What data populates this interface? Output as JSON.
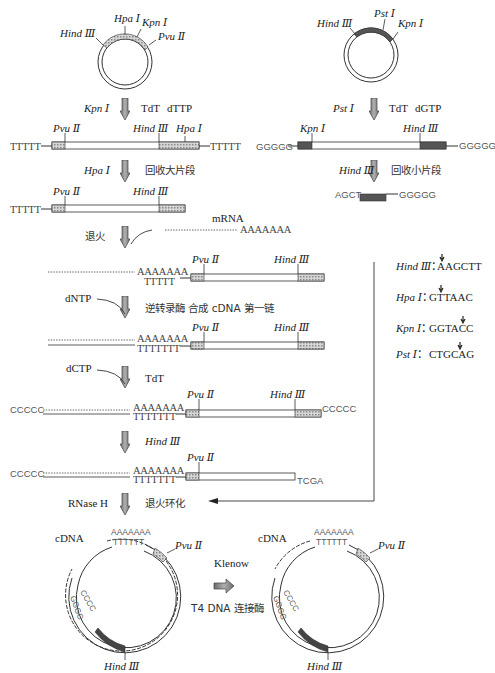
{
  "colors": {
    "line": "#333333",
    "dark_segment": "#3a3a3a",
    "hatched_segment": "#bfbfbf",
    "arrow_fill": "#8a8a8a",
    "background": "#ffffff"
  },
  "left_plasmid": {
    "sites": [
      "Hpa Ⅰ",
      "Kpn Ⅰ",
      "Hind Ⅲ",
      "Pvu Ⅱ"
    ]
  },
  "right_plasmid": {
    "sites": [
      "Pst Ⅰ",
      "Hind Ⅲ",
      "Kpn Ⅰ"
    ]
  },
  "steps": {
    "s1": {
      "enzyme": "Kpn Ⅰ",
      "note1": "TdT",
      "note2": "dTTP"
    },
    "s2": {
      "enzyme": "Hpa Ⅰ",
      "note": "回收大片段"
    },
    "s3": {
      "label": "退火",
      "mrna": "mRNA",
      "polyA": "AAAAAAA"
    },
    "s4": {
      "reagent": "dNTP",
      "note": "逆转录酶 合成 cDNA 第一链"
    },
    "s5": {
      "reagent": "dCTP",
      "note": "TdT"
    },
    "s6": {
      "enzyme": "Hind Ⅲ"
    },
    "s7": {
      "reagent": "RNase H",
      "note": "退火环化"
    },
    "r1": {
      "enzyme": "Pst Ⅰ",
      "note1": "TdT",
      "note2": "dGTP"
    },
    "r2": {
      "enzyme": "Hind Ⅲ",
      "note": "回收小片段"
    }
  },
  "fragments": {
    "f1": {
      "left_tail": "TTTTT",
      "right_tail": "TTTTT",
      "sites": [
        "Pvu Ⅱ",
        "Hind Ⅲ",
        "Hpa Ⅰ"
      ]
    },
    "f2": {
      "left_tail": "TTTTT",
      "sites": [
        "Pvu Ⅱ",
        "Hind Ⅲ"
      ]
    },
    "f3": {
      "polyA": "AAAAAAA",
      "polyT": "TTTTT",
      "sites": [
        "Pvu Ⅱ",
        "Hind Ⅲ"
      ]
    },
    "f4": {
      "polyA": "AAAAAAA",
      "polyT": "TTTTTTT",
      "sites": [
        "Pvu Ⅱ",
        "Hind Ⅲ"
      ]
    },
    "f5": {
      "left_tail": "CCCCC",
      "right_tail": "CCCCC",
      "polyA": "AAAAAAA",
      "polyT": "TTTTTTT",
      "sites": [
        "Pvu Ⅱ",
        "Hind Ⅲ"
      ]
    },
    "f6": {
      "left_tail": "CCCCC",
      "right_tail": "TCGA",
      "polyA": "AAAAAAA",
      "polyT": "TTTTTTT",
      "sites": [
        "Pvu Ⅱ"
      ]
    },
    "g1": {
      "left_tail": "GGGGG",
      "right_tail": "GGGGG",
      "sites": [
        "Kpn Ⅰ",
        "Hind Ⅲ"
      ]
    },
    "g2": {
      "left_tail": "AGCT",
      "right_tail": "GGGGG"
    }
  },
  "legend": {
    "items": [
      {
        "enzyme": "Hind Ⅲ",
        "sep": "：",
        "seq": "AAGCTT"
      },
      {
        "enzyme": "Hpa Ⅰ",
        "sep": "：",
        "seq": "GTTAAC"
      },
      {
        "enzyme": "Kpn Ⅰ",
        "sep": "：",
        "seq": "GGTACC"
      },
      {
        "enzyme": "Pst Ⅰ",
        "sep": "：",
        "seq": "CTGCAG"
      }
    ]
  },
  "bottom": {
    "left": {
      "label": "cDNA",
      "pvu": "Pvu Ⅱ",
      "hind": "Hind Ⅲ",
      "polyA": "AAAAAAA",
      "polyT": "TTTTTT",
      "g": "GGGG",
      "c": "CCCC"
    },
    "right": {
      "label": "cDNA",
      "pvu": "Pvu Ⅱ",
      "hind": "Hind Ⅲ",
      "polyA": "AAAAAAA",
      "polyT": "TTTTTT",
      "g": "GGGG",
      "c": "CCCC"
    },
    "mid_top": "Klenow",
    "mid_bottom": "T4 DNA 连接酶"
  }
}
